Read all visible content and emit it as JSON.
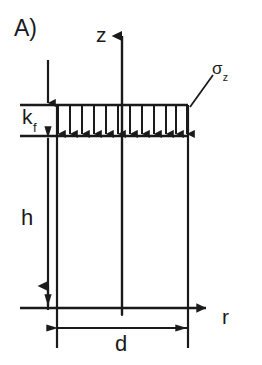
{
  "figure": {
    "panel_label": "A)",
    "type": "engineering-diagram"
  },
  "axes": {
    "vertical": {
      "name": "z",
      "label": "z",
      "direction": "up"
    },
    "horizontal": {
      "name": "r",
      "label": "r",
      "direction": "right"
    }
  },
  "labels": {
    "layer_stiffness": {
      "base": "k",
      "subscript": "f",
      "full": "kf"
    },
    "stress": {
      "base": "σ",
      "subscript": "z",
      "full": "σz"
    },
    "height": "h",
    "diameter": "d"
  },
  "load": {
    "arrow_count": 12,
    "direction": "down",
    "distribution": "uniform"
  },
  "geometry": {
    "body_left_x": 57,
    "body_right_x": 188,
    "surface_y": 105,
    "layer_bottom_y": 136,
    "base_y": 308,
    "axis_x": 122,
    "z_arrow_tip_y": 27,
    "r_arrow_tip_x": 218,
    "dim_d_y": 328,
    "dim_h_x": 48
  },
  "style": {
    "stroke": "#1a1a1a",
    "background": "#ffffff",
    "line_width": 2
  }
}
